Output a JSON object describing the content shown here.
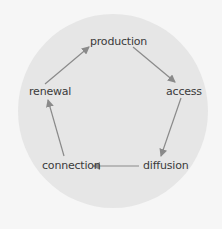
{
  "diagram": {
    "type": "cycle",
    "nodes": [
      {
        "id": "production",
        "label": "production"
      },
      {
        "id": "access",
        "label": "access"
      },
      {
        "id": "diffusion",
        "label": "diffusion"
      },
      {
        "id": "connection",
        "label": "connection"
      },
      {
        "id": "renewal",
        "label": "renewal"
      }
    ],
    "edges": [
      {
        "from": "production",
        "to": "access"
      },
      {
        "from": "access",
        "to": "diffusion"
      },
      {
        "from": "diffusion",
        "to": "connection"
      },
      {
        "from": "connection",
        "to": "renewal"
      },
      {
        "from": "renewal",
        "to": "production"
      }
    ],
    "colors": {
      "background": "#f6f6f6",
      "circle": "#e6e6e6",
      "arrow": "#8a8a8a",
      "text": "#3a3a3a"
    }
  }
}
